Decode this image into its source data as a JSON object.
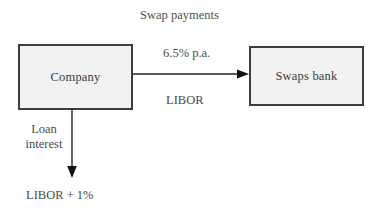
{
  "diagram": {
    "title": "Swap payments",
    "background_color": "#ffffff",
    "box_fill_color": "#f2f2f2",
    "box_border_color": "#3d3d3d",
    "text_color": "#3b3b3b",
    "nodes": [
      {
        "id": "company",
        "label": "Company"
      },
      {
        "id": "swaps_bank",
        "label": "Swaps bank"
      }
    ],
    "edges": [
      {
        "id": "company-to-bank",
        "from": "company",
        "to": "swaps_bank",
        "direction": "right",
        "label_above": "6.5% p.a.",
        "label_below": "LIBOR"
      },
      {
        "id": "company-to-loan",
        "from": "company",
        "to": "loan_payment",
        "direction": "down",
        "label_side": "Loan\ninterest",
        "label_side_line1": "Loan",
        "label_side_line2": "interest",
        "target_label": "LIBOR + 1%"
      }
    ],
    "labels": {
      "title": "Swap payments",
      "fixed_rate": "6.5% p.a.",
      "floating_rate": "LIBOR",
      "loan_interest_line1": "Loan",
      "loan_interest_line2": "interest",
      "loan_outflow": "LIBOR + 1%"
    }
  }
}
